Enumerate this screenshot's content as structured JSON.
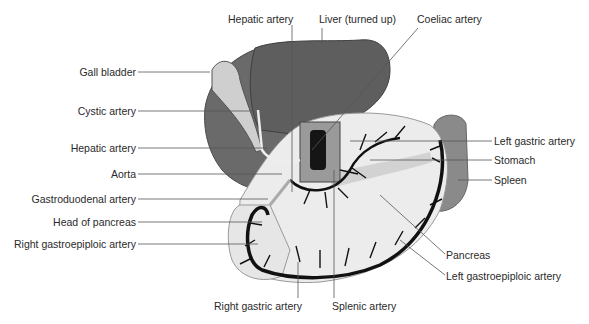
{
  "diagram": {
    "colors": {
      "liver": "#6f6f6f",
      "liver_dark": "#5a5a5a",
      "stomach": "#e9e9e9",
      "spleen": "#8a8a8a",
      "artery": "#111111",
      "leader": "#555555",
      "text": "#2a2a2a"
    },
    "labels": {
      "hepatic_artery_top": "Hepatic artery",
      "liver": "Liver (turned up)",
      "coeliac_artery": "Coeliac artery",
      "gall_bladder": "Gall bladder",
      "cystic_artery": "Cystic artery",
      "hepatic_artery_left": "Hepatic artery",
      "aorta": "Aorta",
      "gastroduodenal_artery": "Gastroduodenal artery",
      "head_of_pancreas": "Head of pancreas",
      "right_gastroepiploic_artery": "Right gastroepiploic artery",
      "left_gastric_artery": "Left gastric artery",
      "stomach": "Stomach",
      "spleen": "Spleen",
      "pancreas": "Pancreas",
      "left_gastroepiploic_artery": "Left gastroepiploic artery",
      "right_gastric_artery": "Right gastric artery",
      "splenic_artery": "Splenic artery"
    }
  }
}
